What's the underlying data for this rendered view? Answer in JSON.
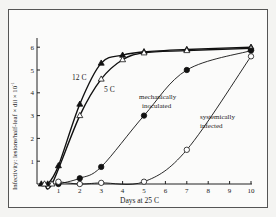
{
  "chart_data": {
    "type": "line",
    "title": "",
    "xlabel": "Days at 25 C",
    "ylabel": "Infectivity: lesions/half-leaf × dil × 10⁻¹",
    "xlim": [
      0,
      10
    ],
    "ylim": [
      0,
      6.5
    ],
    "xticks": [
      1,
      2,
      3,
      4,
      5,
      6,
      7,
      8,
      9,
      10
    ],
    "yticks": [
      1,
      2,
      3,
      4,
      5,
      6
    ],
    "grid": false,
    "legend": "inline annotations",
    "series": [
      {
        "name": "12 C",
        "marker": "filled-triangle",
        "x": [
          0.2,
          0.5,
          1,
          2,
          3,
          4,
          5,
          7,
          10
        ],
        "y": [
          0,
          0,
          0.8,
          3.5,
          5.3,
          5.65,
          5.8,
          5.9,
          6.0
        ]
      },
      {
        "name": "5 C",
        "marker": "open-triangle",
        "x": [
          0.35,
          0.7,
          2,
          3,
          4,
          5,
          7,
          10
        ],
        "y": [
          0,
          0,
          3.0,
          4.6,
          5.45,
          5.75,
          5.85,
          5.95
        ]
      },
      {
        "name": "mechanically inoculated",
        "marker": "filled-circle",
        "x": [
          1,
          2,
          3,
          5,
          7,
          10
        ],
        "y": [
          0,
          0.25,
          0.75,
          3.0,
          5.0,
          5.85
        ]
      },
      {
        "name": "systemically infected",
        "marker": "open-circle",
        "x": [
          1,
          2,
          3,
          5,
          7,
          10
        ],
        "y": [
          0.1,
          0,
          0.05,
          0.1,
          1.5,
          5.6
        ]
      }
    ],
    "annotations": [
      "12 C",
      "5 C",
      "mechanically inoculated",
      "systemically infected"
    ]
  },
  "labels": {
    "xlabel": "Days at 25 C",
    "ylabel": "Infectivity: lesions/half-leaf × dil × 10",
    "ylabel_exp": "-1",
    "ann_12c": "12 C",
    "ann_5c": "5 C",
    "ann_mech_1": "mechanically",
    "ann_mech_2": "inoculated",
    "ann_sys_1": "systemically",
    "ann_sys_2": "infected",
    "xt": [
      "1",
      "2",
      "3",
      "4",
      "5",
      "6",
      "7",
      "8",
      "9",
      "10"
    ],
    "yt": [
      "1",
      "2",
      "3",
      "4",
      "5",
      "6"
    ]
  }
}
